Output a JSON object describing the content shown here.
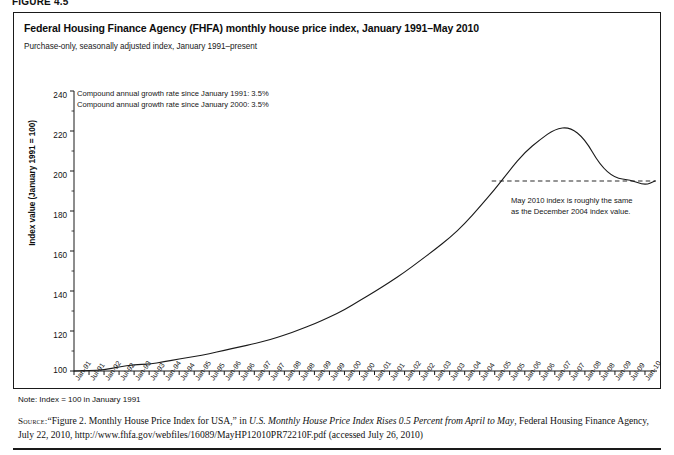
{
  "figure": {
    "label": "FIGURE 4.5"
  },
  "chart": {
    "title": "Federal Housing Finance Agency (FHFA) monthly house price index, January 1991–May 2010",
    "subtitle": "Purchase-only, seasonally adjusted index, January 1991–present",
    "annotation_growth_line1": "Compound annual growth rate since January 1991: 3.5%",
    "annotation_growth_line2": "Compound annual growth rate since January 2000: 3.5%",
    "annotation_dashed_line1": "May 2010 index is roughly the same",
    "annotation_dashed_line2": "as the December 2004 index value."
  },
  "note": {
    "text": "Note: Index = 100 in January 1991"
  },
  "source": {
    "label": "Source:",
    "part1": "“Figure 2. Monthly House Price Index for USA,” in ",
    "italic1": "U.S. Monthly House Price Index Rises 0.5 Percent from April to May",
    "part2": ", Federal Housing Finance Agency, July 22, 2010, http://www.fhfa.gov/webfiles/16089/MayHP12010PR72210F.pdf (accessed July 26, 2010)"
  },
  "colors": {
    "line": "#1a1a1a",
    "axis": "#1a1a1a",
    "dashed": "#2b2b2b",
    "background": "#ffffff"
  },
  "chart_data": {
    "type": "line",
    "title": "Federal Housing Finance Agency (FHFA) monthly house price index, January 1991–May 2010",
    "subtitle": "Purchase-only, seasonally adjusted index, January 1991–present",
    "xlabel": "",
    "ylabel": "Index value (January 1991 = 100)",
    "ylim": [
      100,
      240
    ],
    "yticks": [
      100,
      120,
      140,
      160,
      180,
      200,
      220,
      240
    ],
    "grid": false,
    "legend": null,
    "xtick_labels": [
      "Jan-91",
      "Jul-91",
      "Jan-92",
      "Jul-92",
      "Jan-93",
      "Jul-93",
      "Jan-94",
      "Jul-94",
      "Jan-95",
      "Jul-95",
      "Jan-96",
      "Jul-96",
      "Jan-97",
      "Jul-97",
      "Jan-98",
      "Jul-98",
      "Jan-99",
      "Jul-99",
      "Jan-00",
      "Jul-00",
      "Jan-01",
      "Jul-01",
      "Jan-02",
      "Jul-02",
      "Jan-03",
      "Jul-03",
      "Jan-04",
      "Jul-04",
      "Jan-05",
      "Jul-05",
      "Jan-06",
      "Jul-06",
      "Jan-07",
      "Jul-07",
      "Jan-08",
      "Jul-08",
      "Jan-09",
      "Jul-09",
      "Jan-10"
    ],
    "x": [
      "Jan-91",
      "Jul-91",
      "Jan-92",
      "Jul-92",
      "Jan-93",
      "Jul-93",
      "Jan-94",
      "Jul-94",
      "Jan-95",
      "Jul-95",
      "Jan-96",
      "Jul-96",
      "Jan-97",
      "Jul-97",
      "Jan-98",
      "Jul-98",
      "Jan-99",
      "Jul-99",
      "Jan-00",
      "Jul-00",
      "Jan-01",
      "Jul-01",
      "Jan-02",
      "Jul-02",
      "Jan-03",
      "Jul-03",
      "Jan-04",
      "Jul-04",
      "Jan-05",
      "Jul-05",
      "Jan-06",
      "Jul-06",
      "Jan-07",
      "Jul-07",
      "Jan-08",
      "Jul-08",
      "Jan-09",
      "Jul-09",
      "Jan-10",
      "May-10"
    ],
    "series": [
      {
        "name": "FHFA purchase-only house price index",
        "values": [
          100.0,
          100.2,
          100.6,
          102.0,
          103.2,
          103.4,
          104.6,
          106.0,
          107.2,
          108.6,
          110.4,
          112.0,
          113.6,
          115.6,
          118.0,
          120.6,
          123.6,
          127.0,
          130.6,
          135.2,
          139.6,
          144.4,
          149.4,
          155.0,
          160.6,
          166.6,
          173.6,
          182.0,
          190.8,
          200.4,
          209.4,
          215.6,
          221.0,
          222.0,
          216.0,
          203.0,
          196.4,
          195.6,
          192.8,
          195.0
        ]
      }
    ],
    "reference_line": {
      "label": "December 2004 index value",
      "value": 195.0,
      "x_start": "Dec-04",
      "x_end": "May-10",
      "style": "dashed"
    },
    "annotations": [
      "Compound annual growth rate since January 1991: 3.5%",
      "Compound annual growth rate since January 2000: 3.5%",
      "May 2010 index is roughly the same as the December 2004 index value."
    ]
  }
}
